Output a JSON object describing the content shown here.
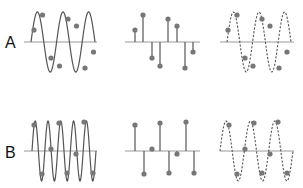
{
  "figure": {
    "rows": [
      {
        "label": "A",
        "axis_y": 42,
        "amplitude": 30,
        "continuous": {
          "x_start": 31,
          "x_end": 95,
          "cycles": 2.5,
          "phase_deg": 0
        },
        "samples": {
          "x": [
            34,
            42.5,
            51,
            59.5,
            68,
            76.5,
            85,
            93.5
          ],
          "y": [
            30,
            15,
            58,
            66,
            19,
            26,
            68,
            52
          ]
        },
        "stems": {
          "x": [
            135,
            143,
            152,
            160,
            168,
            177,
            185,
            193
          ],
          "y": [
            30,
            15,
            58,
            66,
            19,
            26,
            68,
            52
          ]
        },
        "reconstructed": {
          "x_start": 227,
          "x_end": 291,
          "cycles": 2.5,
          "phase_deg": 0
        },
        "recon_samples": {
          "x": [
            228,
            237,
            245,
            253,
            262,
            270,
            279,
            287
          ],
          "y": [
            30,
            15,
            58,
            66,
            19,
            26,
            68,
            52
          ]
        }
      },
      {
        "label": "B",
        "axis_y": 151,
        "amplitude": 30,
        "continuous": {
          "x_start": 32,
          "x_end": 96,
          "cycles": 5,
          "phase_deg": 0
        },
        "samples": {
          "x": [
            34,
            42,
            51,
            59,
            67,
            76,
            84,
            93
          ],
          "y": [
            125,
            174,
            149,
            123,
            173,
            154,
            122,
            173
          ]
        },
        "stems": {
          "x": [
            135,
            144,
            152,
            160,
            169,
            177,
            186,
            194
          ],
          "y": [
            125,
            174,
            149,
            123,
            173,
            154,
            122,
            173
          ]
        },
        "reconstructed": {
          "x_start": 220,
          "x_end": 293,
          "cycles": 3,
          "phase_deg": 0
        },
        "recon_samples": {
          "x": [
            229,
            237,
            245,
            254,
            262,
            270,
            278,
            287
          ],
          "y": [
            125,
            174,
            149,
            123,
            173,
            154,
            122,
            173
          ]
        }
      }
    ],
    "axes": {
      "left": {
        "x_start": 24,
        "x_end": 97
      },
      "middle": {
        "x_start": 125,
        "x_end": 200
      },
      "right": {
        "x_start": 220,
        "x_end": 294
      }
    },
    "colors": {
      "curve": "#555555",
      "axis": "#9a9a9a",
      "dot": "#777777",
      "text": "#111111"
    }
  }
}
